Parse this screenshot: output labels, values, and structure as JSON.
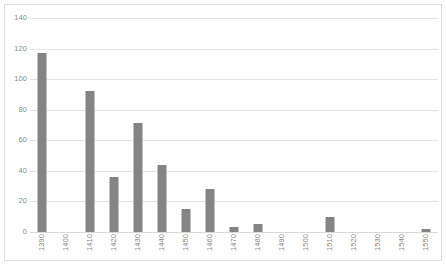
{
  "chart_data": {
    "type": "bar",
    "title": "",
    "subtitle": "",
    "xlabel": "",
    "ylabel": "",
    "categories": [
      "1390",
      "1400",
      "1410",
      "1420",
      "1430",
      "1440",
      "1450",
      "1460",
      "1470",
      "1480",
      "1490",
      "1500",
      "1510",
      "1520",
      "1530",
      "1540",
      "1550"
    ],
    "values": [
      117,
      0,
      92,
      36,
      71,
      44,
      15,
      28,
      3,
      5,
      0,
      0,
      10,
      0,
      0,
      0,
      2
    ],
    "ylim": [
      0,
      140
    ],
    "ytick_labels": [
      "0",
      "20",
      "40",
      "60",
      "80",
      "100",
      "120",
      "140"
    ],
    "ytick_values": [
      0,
      20,
      40,
      60,
      80,
      100,
      120,
      140
    ],
    "grid": true,
    "legend": false,
    "legend_position": "none",
    "bar_color": "#848484",
    "gridline_color": "#e4e4e4",
    "axis_text_color": "#8a8a8a",
    "plot_background": "#ffffff",
    "border_color": "#dcdcdc",
    "xtick_rotation": "90"
  }
}
